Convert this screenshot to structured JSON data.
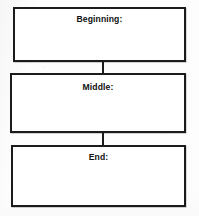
{
  "document": {
    "type": "graphic-organizer-worksheet",
    "background_color": "#fdfdfd",
    "ink_color": "#1b1b1b"
  },
  "boxes": [
    {
      "id": "beginning",
      "label": "Beginning:",
      "content": ""
    },
    {
      "id": "middle",
      "label": "Middle:",
      "content": ""
    },
    {
      "id": "end",
      "label": "End:",
      "content": ""
    }
  ],
  "connectors": [
    {
      "id": "connector-1",
      "from": "beginning",
      "to": "middle"
    },
    {
      "id": "connector-2",
      "from": "middle",
      "to": "end"
    }
  ]
}
